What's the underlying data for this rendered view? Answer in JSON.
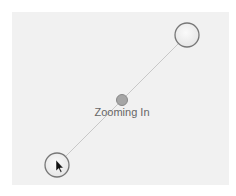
{
  "gesture": {
    "label": "Zooming In",
    "type": "pinch-zoom",
    "touch_points": [
      {
        "name": "touch-point-top-right",
        "cx": 187,
        "cy": 35,
        "r": 12
      },
      {
        "name": "touch-point-bottom-left",
        "cx": 57,
        "cy": 165,
        "r": 12
      }
    ],
    "center": {
      "cx": 122,
      "cy": 100,
      "r": 6
    }
  },
  "colors": {
    "canvas": "#f1f1f1",
    "line": "#c8c8c8",
    "touch_fill": "#f4f4f4",
    "touch_stroke": "#777777",
    "center_fill": "#a6a6a6",
    "label": "#666666"
  }
}
